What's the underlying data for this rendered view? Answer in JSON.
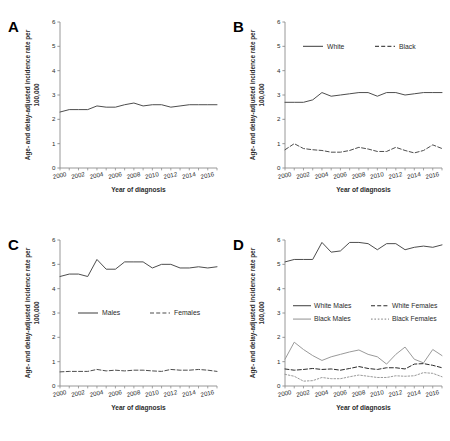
{
  "figure": {
    "panels": [
      "A",
      "B",
      "C",
      "D"
    ],
    "axis": {
      "ylabel_line1": "Age- and delay-adjusted incidence rate per",
      "ylabel_line2": "100,000",
      "xlabel": "Year of diagnosis",
      "yticks": [
        "0",
        "1",
        "2",
        "3",
        "4",
        "5",
        "6"
      ],
      "xticks": [
        "2000",
        "2002",
        "2004",
        "2006",
        "2008",
        "2010",
        "2012",
        "2014",
        "2016"
      ]
    },
    "caption": "",
    "colors": {
      "line_dark": "#4d4d4d",
      "line_gray": "#9a9a9a",
      "axis": "#8c8c8c",
      "text": "#2b2b2b"
    }
  },
  "chart_data": [
    {
      "type": "line",
      "panel": "A",
      "title": "A",
      "xlabel": "Year of diagnosis",
      "ylabel": "Age- and delay-adjusted incidence rate per 100,000",
      "xlim": [
        2000,
        2017
      ],
      "ylim": [
        0,
        6
      ],
      "grid": false,
      "legend": null,
      "x": [
        2000,
        2001,
        2002,
        2003,
        2004,
        2005,
        2006,
        2007,
        2008,
        2009,
        2010,
        2011,
        2012,
        2013,
        2014,
        2015,
        2016,
        2017
      ],
      "series": [
        {
          "name": "Overall",
          "style": "solid",
          "color": "#4d4d4d",
          "values": [
            2.3,
            2.4,
            2.4,
            2.4,
            2.55,
            2.5,
            2.5,
            2.6,
            2.67,
            2.55,
            2.6,
            2.6,
            2.5,
            2.55,
            2.6,
            2.6,
            2.6,
            2.6
          ]
        }
      ]
    },
    {
      "type": "line",
      "panel": "B",
      "title": "B",
      "xlabel": "Year of diagnosis",
      "ylabel": "Age- and delay-adjusted incidence rate per 100,000",
      "xlim": [
        2000,
        2017
      ],
      "ylim": [
        0,
        6
      ],
      "grid": false,
      "legend": {
        "position": "top",
        "entries": [
          "White",
          "Black"
        ]
      },
      "x": [
        2000,
        2001,
        2002,
        2003,
        2004,
        2005,
        2006,
        2007,
        2008,
        2009,
        2010,
        2011,
        2012,
        2013,
        2014,
        2015,
        2016,
        2017
      ],
      "series": [
        {
          "name": "White",
          "style": "solid",
          "color": "#4d4d4d",
          "values": [
            2.7,
            2.7,
            2.7,
            2.8,
            3.1,
            2.95,
            3.0,
            3.05,
            3.1,
            3.1,
            2.95,
            3.1,
            3.1,
            3.0,
            3.05,
            3.1,
            3.1,
            3.1
          ]
        },
        {
          "name": "Black",
          "style": "dashed",
          "color": "#4d4d4d",
          "values": [
            0.75,
            1.0,
            0.8,
            0.75,
            0.72,
            0.65,
            0.65,
            0.72,
            0.85,
            0.78,
            0.68,
            0.68,
            0.85,
            0.72,
            0.62,
            0.72,
            0.95,
            0.8
          ]
        }
      ]
    },
    {
      "type": "line",
      "panel": "C",
      "title": "C",
      "xlabel": "Year of diagnosis",
      "ylabel": "Age- and delay-adjusted incidence rate per 100,000",
      "xlim": [
        2000,
        2017
      ],
      "ylim": [
        0,
        6
      ],
      "grid": false,
      "legend": {
        "position": "middle",
        "entries": [
          "Males",
          "Females"
        ]
      },
      "x": [
        2000,
        2001,
        2002,
        2003,
        2004,
        2005,
        2006,
        2007,
        2008,
        2009,
        2010,
        2011,
        2012,
        2013,
        2014,
        2015,
        2016,
        2017
      ],
      "series": [
        {
          "name": "Males",
          "style": "solid",
          "color": "#4d4d4d",
          "values": [
            4.5,
            4.6,
            4.6,
            4.5,
            5.2,
            4.8,
            4.8,
            5.1,
            5.1,
            5.1,
            4.85,
            5.0,
            5.0,
            4.85,
            4.85,
            4.9,
            4.85,
            4.9
          ]
        },
        {
          "name": "Females",
          "style": "dashed",
          "color": "#4d4d4d",
          "values": [
            0.58,
            0.6,
            0.6,
            0.6,
            0.68,
            0.62,
            0.65,
            0.62,
            0.65,
            0.65,
            0.62,
            0.6,
            0.68,
            0.65,
            0.65,
            0.68,
            0.65,
            0.6
          ]
        }
      ]
    },
    {
      "type": "line",
      "panel": "D",
      "title": "D",
      "xlabel": "Year of diagnosis",
      "ylabel": "Age- and delay-adjusted incidence rate per 100,000",
      "xlim": [
        2000,
        2017
      ],
      "ylim": [
        0,
        6
      ],
      "grid": false,
      "legend": {
        "position": "middle",
        "entries": [
          "White Males",
          "White Females",
          "Black Males",
          "Black Females"
        ]
      },
      "x": [
        2000,
        2001,
        2002,
        2003,
        2004,
        2005,
        2006,
        2007,
        2008,
        2009,
        2010,
        2011,
        2012,
        2013,
        2014,
        2015,
        2016,
        2017
      ],
      "series": [
        {
          "name": "White Males",
          "style": "solid",
          "color": "#4d4d4d",
          "values": [
            5.1,
            5.2,
            5.2,
            5.2,
            5.9,
            5.5,
            5.55,
            5.9,
            5.9,
            5.85,
            5.6,
            5.85,
            5.85,
            5.6,
            5.7,
            5.75,
            5.7,
            5.8
          ]
        },
        {
          "name": "White Females",
          "style": "dashed",
          "color": "#2b2b2b",
          "values": [
            0.7,
            0.65,
            0.68,
            0.72,
            0.68,
            0.7,
            0.65,
            0.72,
            0.8,
            0.72,
            0.68,
            0.75,
            0.75,
            0.7,
            0.9,
            0.92,
            0.85,
            0.75
          ]
        },
        {
          "name": "Black Males",
          "style": "solid",
          "color": "#9a9a9a",
          "values": [
            1.1,
            1.8,
            1.5,
            1.25,
            1.05,
            1.2,
            1.3,
            1.4,
            1.48,
            1.3,
            1.2,
            0.9,
            1.3,
            1.6,
            1.1,
            0.95,
            1.5,
            1.25
          ]
        },
        {
          "name": "Black Females",
          "style": "dotted",
          "color": "#9a9a9a",
          "values": [
            0.48,
            0.4,
            0.2,
            0.22,
            0.35,
            0.3,
            0.3,
            0.38,
            0.45,
            0.4,
            0.35,
            0.35,
            0.42,
            0.4,
            0.42,
            0.55,
            0.52,
            0.38
          ]
        }
      ]
    }
  ]
}
